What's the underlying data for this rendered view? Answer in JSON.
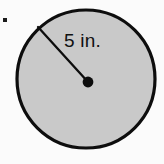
{
  "figure": {
    "kind": "geometry-diagram",
    "background_color": "#fbfbfb"
  },
  "bullet": {
    "label": "",
    "shape": "square-bullet",
    "color": "#1a1a1a",
    "x": 3,
    "y": 18,
    "size": 4
  },
  "circle": {
    "center_x": 86,
    "center_y": 79,
    "radius": 69,
    "fill_color": "#c9c9c9",
    "stroke_color": "#0d0d0d",
    "stroke_width": 3.2
  },
  "center_dot": {
    "x": 88,
    "y": 82,
    "radius": 5.4,
    "color": "#0d0d0d"
  },
  "radius_segment": {
    "x1": 38,
    "y1": 27,
    "x2": 88,
    "y2": 82,
    "stroke_color": "#0d0d0d",
    "stroke_width": 2.3
  },
  "radius_label": {
    "text": "5 in.",
    "value": "5",
    "unit": "in.",
    "x": 64,
    "y": 47,
    "font_size": "19px",
    "color": "#111111"
  }
}
